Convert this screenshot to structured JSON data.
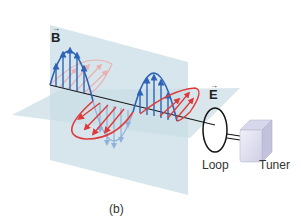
{
  "labels": {
    "magnetic_field": "B",
    "electric_field": "E",
    "vector_arrow": "→",
    "loop": "Loop",
    "tuner": "Tuner",
    "caption": "(b)"
  },
  "colors": {
    "magnetic_wave": "#2e63b8",
    "magnetic_wave_faded": "#8fb0d8",
    "electric_wave": "#e0393a",
    "electric_wave_faded": "#eab0ae",
    "plane": "#c9dde6",
    "axis": "#1a1a1a",
    "tuner_front": "#e4e4f2",
    "tuner_side": "#c9c9e0"
  }
}
